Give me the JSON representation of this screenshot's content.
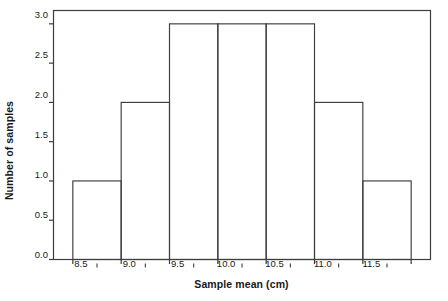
{
  "chart_data": {
    "type": "bar",
    "title": "",
    "subtitle": "",
    "xlabel": "Sample mean (cm)",
    "ylabel": "Number of samples",
    "categories": [
      "8.5",
      "9.0",
      "9.5",
      "10.0",
      "10.5",
      "11.0",
      "11.5"
    ],
    "values": [
      1,
      2,
      3,
      3,
      3,
      2,
      1
    ],
    "bin_edges": [
      8.25,
      8.75,
      9.25,
      9.75,
      10.25,
      10.75,
      11.25,
      11.75
    ],
    "bin_width": 0.5,
    "bars": [
      {
        "label": "8.5",
        "left": 8.25,
        "right": 8.75,
        "value": 1
      },
      {
        "label": "9.0",
        "left": 8.75,
        "right": 9.25,
        "value": 2
      },
      {
        "label": "9.5",
        "left": 9.25,
        "right": 9.75,
        "value": 3
      },
      {
        "label": "10.0",
        "left": 9.75,
        "right": 10.25,
        "value": 3
      },
      {
        "label": "10.5",
        "left": 10.25,
        "right": 10.75,
        "value": 3
      },
      {
        "label": "11.0",
        "left": 10.75,
        "right": 11.25,
        "value": 2
      },
      {
        "label": "11.5",
        "left": 11.25,
        "right": 11.75,
        "value": 1
      }
    ],
    "xlim": [
      8.05,
      11.95
    ],
    "ylim": [
      0,
      3.17
    ],
    "xtick_labels": [
      "8.5",
      "9.0",
      "9.5",
      "10.0",
      "10.5",
      "11.0",
      "11.5"
    ],
    "xtick_values": [
      8.5,
      9.0,
      9.5,
      10.0,
      10.5,
      11.0,
      11.5
    ],
    "ytick_labels": [
      "0.0",
      "0.5",
      "1.0",
      "1.5",
      "2.0",
      "2.5",
      "3.0"
    ],
    "ytick_values": [
      0.0,
      0.5,
      1.0,
      1.5,
      2.0,
      2.5,
      3.0
    ],
    "grid": false,
    "legend": null,
    "bar_fill": "none",
    "bar_edge_color": "#3c3c3c",
    "axis_color": "#3c3c3c",
    "background": "#ffffff",
    "total_samples": 15
  }
}
